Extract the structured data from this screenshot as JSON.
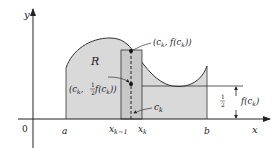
{
  "diagram": {
    "axes": {
      "x_label": "x",
      "y_label": "y",
      "origin_label": "0"
    },
    "region_label": "R",
    "tick_labels": {
      "a": "a",
      "x_km1_main": "x",
      "x_km1_sub": "k−1",
      "x_k_main": "x",
      "x_k_sub": "k",
      "b": "b"
    },
    "annotations": {
      "top_point": "(c",
      "top_point_sub": "k",
      "top_point_rest": ", f(c",
      "top_point_sub2": "k",
      "top_point_end": "))",
      "mid_point_open": "(c",
      "mid_point_sub": "k",
      "mid_point_comma": ", ",
      "half_num": "1",
      "half_den": "2",
      "mid_point_f": " f(c",
      "mid_point_sub2": "k",
      "mid_point_end": "))",
      "ck_main": "c",
      "ck_sub": "k",
      "half_height_f": "f(c",
      "half_height_sub": "k",
      "half_height_end": ")"
    },
    "colors": {
      "region_fill": "#d9d9d9",
      "strip_fill": "#c8c8c8",
      "stroke": "#333333"
    }
  }
}
